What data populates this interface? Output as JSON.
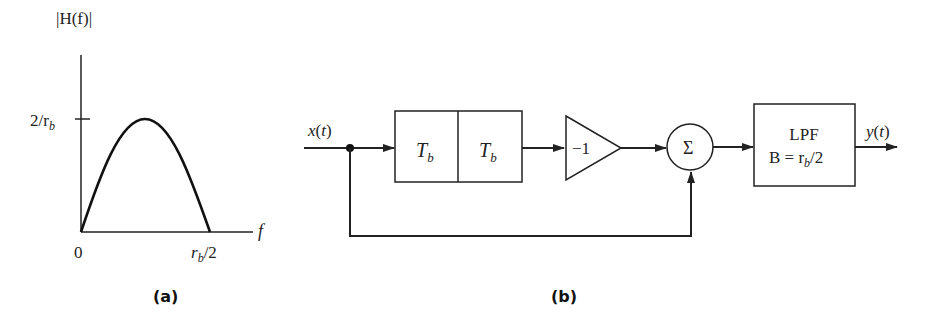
{
  "figure_a": {
    "caption": "(a)",
    "y_axis_label": "|H(f)|",
    "x_axis_label": "f",
    "y_tick_label": "2/r",
    "y_tick_sub": "b",
    "x_origin_label": "0",
    "x_end_label_r": "r",
    "x_end_label_sub": "b",
    "x_end_label_rest": "/2"
  },
  "figure_b": {
    "caption": "(b)",
    "input_label": "x(t)",
    "output_label": "y(t)",
    "delay1": {
      "main": "T",
      "sub": "b"
    },
    "delay2": {
      "main": "T",
      "sub": "b"
    },
    "gain_label": "−1",
    "summer_label": "Σ",
    "lpf_title": "LPF",
    "lpf_bw_prefix": "B = r",
    "lpf_bw_sub": "b",
    "lpf_bw_suffix": "/2"
  },
  "colors": {
    "line": "#222222",
    "background": "#ffffff"
  }
}
